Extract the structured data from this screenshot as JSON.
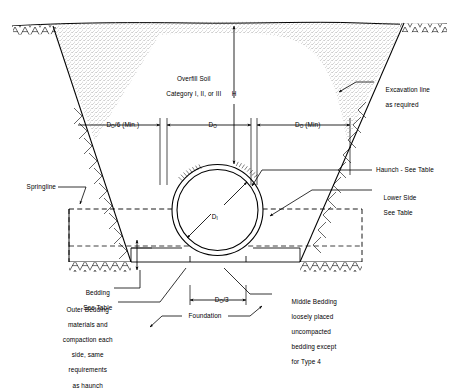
{
  "diagram": {
    "type": "engineering-cross-section",
    "colors": {
      "line": "#000000",
      "background": "#ffffff",
      "stipple": "#8a8a8a",
      "hatch": "#000000"
    }
  },
  "labels": {
    "overfill_soil": "Overfill Soil",
    "overfill_category": "Category I, II, or III",
    "height_h": "H",
    "excavation_line": "Excavation line",
    "excavation_line2": "as required",
    "haunch": "Haunch - See Table",
    "lower_side": "Lower Side",
    "lower_side2": "See Table",
    "springline": "Springline",
    "bedding": "Bedding",
    "bedding2": "See Table",
    "outer_bedding_1": "Outer Bedding",
    "outer_bedding_2": "materials and",
    "outer_bedding_3": "compaction each",
    "outer_bedding_4": "side, same",
    "outer_bedding_5": "requirements",
    "outer_bedding_6": "as haunch",
    "middle_bedding_1": "Middle Bedding",
    "middle_bedding_2": "loosely placed",
    "middle_bedding_3": "uncompacted",
    "middle_bedding_4": "bedding except",
    "middle_bedding_5": "for Type 4",
    "foundation": "Foundation"
  },
  "dimensions": {
    "left_clearance_main": "D",
    "left_clearance_sub": "O",
    "left_clearance_tail": "/6 (Min.)",
    "pipe_outer_main": "D",
    "pipe_outer_sub": "O",
    "right_clearance_main": "D",
    "right_clearance_sub": "O",
    "right_clearance_tail": " (Min)",
    "middle_bedding_main": "D",
    "middle_bedding_sub": "O",
    "middle_bedding_tail": "/3",
    "inner_diameter_main": "D",
    "inner_diameter_sub": "I"
  },
  "icons": {
    "arrow": "dimension-arrow-icon",
    "leader": "leader-line-icon"
  }
}
